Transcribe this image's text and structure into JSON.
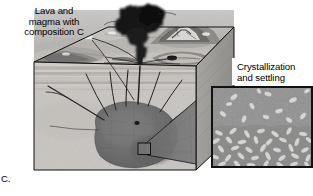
{
  "figure": {
    "panel_letter": "C.",
    "type": "geologic-block-diagram",
    "background_color": "#ffffff",
    "palette": {
      "sky": "#b9b9b9",
      "terrain_light": "#cfcccb",
      "terrain_mid": "#a8a6a4",
      "crust_light": "#cdcac6",
      "crust_band": "#bcb9b5",
      "magma_chamber": "#6f6f70",
      "plume_dark": "#1a1a1a",
      "dike_line": "#2b2b2b",
      "inset_melt": "#8e8e8e",
      "inset_crystal": "#d9d7d3",
      "outline": "#111111"
    },
    "labels": {
      "lava": "Lava and\nmagma with\ncomposition C",
      "crystallization": "Crystallization\nand settling"
    },
    "leader_lines": [
      {
        "name": "lava-to-vent",
        "from": [
          96,
          34
        ],
        "to": [
          150,
          62
        ]
      },
      {
        "name": "lava-to-dike",
        "from": [
          96,
          36
        ],
        "to": [
          140,
          96
        ]
      },
      {
        "name": "callout-cone-top",
        "from": [
          146,
          146
        ],
        "to": [
          211,
          86
        ]
      },
      {
        "name": "callout-cone-bottom",
        "from": [
          146,
          154
        ],
        "to": [
          211,
          168
        ]
      }
    ],
    "callout_box": {
      "name": "magnified-region",
      "x": 138,
      "y": 143,
      "w": 13,
      "h": 12
    },
    "inset": {
      "name": "crystallization-inset",
      "x": 211,
      "y": 86,
      "w": 102,
      "h": 82,
      "upper_zone": "suspended crystals in melt",
      "lower_zone": "accumulated settled crystals",
      "suspended_crystal_count": 13,
      "settled_layer_top_fraction": 0.46
    },
    "block": {
      "top_surface": "eroded volcanic landscape with stratovolcano and lava flows",
      "front_face": "layered sedimentary crust cut by radiating dikes",
      "right_face": "3D perspective side panel",
      "magma_chamber": "large dark pluton at depth",
      "eruption_plume": "dark ash column rising from central vent",
      "dike_count": 9
    }
  }
}
